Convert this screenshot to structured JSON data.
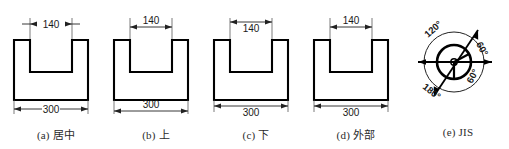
{
  "drawing": {
    "title": "Dimension text placement variants on U-shaped profile",
    "line_color": "#000000",
    "dim_line_color": "#333333",
    "text_color": "#1a1a1a",
    "shape": {
      "name": "u-channel-profile",
      "overall_width_label": "300",
      "slot_width_label": "140"
    }
  },
  "figures": [
    {
      "key": "a",
      "caption": "(a) 居中",
      "caption_index": "(a)",
      "caption_name": "居中",
      "mode": "centered",
      "top_dim": {
        "value": "140",
        "placement": "centered-break",
        "arrows": "outside"
      },
      "bottom_dim": {
        "value": "300",
        "placement": "centered-break",
        "arrows": "inside"
      }
    },
    {
      "key": "b",
      "caption": "(b) 上",
      "caption_index": "(b)",
      "caption_name": "上",
      "mode": "above",
      "top_dim": {
        "value": "140",
        "placement": "above",
        "arrows": "inside"
      },
      "bottom_dim": {
        "value": "300",
        "placement": "above",
        "arrows": "inside"
      }
    },
    {
      "key": "c",
      "caption": "(c) 下",
      "caption_index": "(c)",
      "caption_name": "下",
      "mode": "below",
      "top_dim": {
        "value": "140",
        "placement": "below",
        "arrows": "inside"
      },
      "bottom_dim": {
        "value": "300",
        "placement": "below",
        "arrows": "inside"
      }
    },
    {
      "key": "d",
      "caption": "(d) 外部",
      "caption_index": "(d)",
      "caption_name": "外部",
      "mode": "outside",
      "top_dim": {
        "value": "140",
        "placement": "above",
        "arrows": "inside"
      },
      "bottom_dim": {
        "value": "300",
        "placement": "below",
        "arrows": "inside"
      }
    },
    {
      "key": "e",
      "caption": "(e) JIS",
      "caption_index": "(e)",
      "caption_name": "JIS",
      "mode": "jis",
      "angles": [
        "120°",
        "60°",
        "180°",
        "60°"
      ]
    }
  ],
  "jis_diagram": {
    "name": "jis-angle-text-orientation",
    "label_top_left": "120°",
    "label_top_right": "60°",
    "label_bottom_left": "180°",
    "label_bottom_right": "60°"
  }
}
